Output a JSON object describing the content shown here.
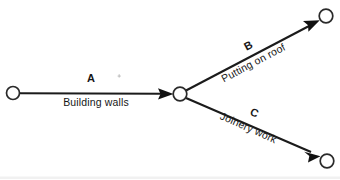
{
  "diagram": {
    "type": "activity-on-arrow-network",
    "background_color": "#ffffff",
    "line_color": "#1b1b1b",
    "text_color": "#161616",
    "nodes": [
      {
        "id": "start",
        "name": "start-node",
        "cx": 13,
        "cy": 93,
        "r": 6.5
      },
      {
        "id": "middle",
        "name": "middle-node",
        "cx": 180,
        "cy": 94,
        "r": 6.8
      },
      {
        "id": "top-right",
        "name": "top-right-node",
        "cx": 326,
        "cy": 16,
        "r": 6.8
      },
      {
        "id": "bottom-right",
        "name": "bottom-right-node",
        "cx": 327,
        "cy": 161,
        "r": 6.8
      }
    ],
    "edges": [
      {
        "id": "A",
        "name": "edge-a",
        "code": "A",
        "label": "Building walls",
        "from": "start",
        "to": "middle",
        "code_x": 91,
        "code_y": 82,
        "label_x": 96,
        "label_y": 106,
        "rotation": 0
      },
      {
        "id": "B",
        "name": "edge-b",
        "code": "B",
        "label": "Putting on roof",
        "from": "middle",
        "to": "top-right",
        "code_x": 250,
        "code_y": 49,
        "label_x": 255,
        "label_y": 66,
        "rotation": -28
      },
      {
        "id": "C",
        "name": "edge-c",
        "code": "C",
        "label": "Joinery work",
        "from": "middle",
        "to": "bottom-right",
        "code_x": 253,
        "code_y": 116,
        "label_x": 247,
        "label_y": 131,
        "rotation": 24
      }
    ],
    "artifacts": [
      {
        "name": "scan-speck",
        "x": 119,
        "y": 78
      }
    ]
  }
}
